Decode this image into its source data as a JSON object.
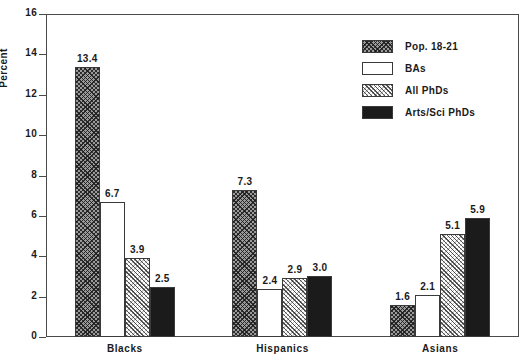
{
  "chart_data": {
    "type": "bar",
    "title": "",
    "xlabel": "",
    "ylabel": "Percent",
    "ylim": [
      0,
      16
    ],
    "yticks": [
      0,
      2,
      4,
      6,
      8,
      10,
      12,
      14,
      16
    ],
    "ytick_labels": [
      "0",
      "2",
      "4",
      "6",
      "8",
      "10",
      "12",
      "14",
      "16"
    ],
    "grid": false,
    "legend_position": "top-right",
    "categories": [
      "Blacks",
      "Hispanics",
      "Asians"
    ],
    "series": [
      {
        "name": "Pop. 18-21",
        "pattern": "crosshatch",
        "values": [
          13.4,
          7.3,
          1.6
        ],
        "labels": [
          "13.4",
          "7.3",
          "1.6"
        ]
      },
      {
        "name": "BAs",
        "pattern": "white",
        "values": [
          6.7,
          2.4,
          2.1
        ],
        "labels": [
          "6.7",
          "2.4",
          "2.1"
        ]
      },
      {
        "name": "All PhDs",
        "pattern": "diagonal",
        "values": [
          3.9,
          2.9,
          5.1
        ],
        "labels": [
          "3.9",
          "2.9",
          "5.1"
        ]
      },
      {
        "name": "Arts/Sci PhDs",
        "pattern": "solid",
        "values": [
          2.5,
          3.0,
          5.9
        ],
        "labels": [
          "2.5",
          "3.0",
          "5.9"
        ]
      }
    ],
    "colors": {
      "axis": "#4a4a4a",
      "bar_outline": "#3a3a3a",
      "crosshatch": "#9a9a9a",
      "white": "#ffffff",
      "diagonal": "#ffffff",
      "solid": "#1b1b1b",
      "text": "#1a1a1a"
    }
  },
  "legend": {
    "items": [
      {
        "label": "Pop. 18-21",
        "pattern": "crosshatch"
      },
      {
        "label": "BAs",
        "pattern": "white"
      },
      {
        "label": "All PhDs",
        "pattern": "diagonal"
      },
      {
        "label": "Arts/Sci PhDs",
        "pattern": "solid"
      }
    ]
  }
}
